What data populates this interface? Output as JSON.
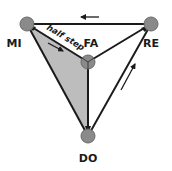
{
  "diagram": {
    "type": "tetrahedron",
    "nodes": [
      {
        "id": "mi",
        "label": "MI",
        "x": 27,
        "y": 24
      },
      {
        "id": "re",
        "label": "RE",
        "x": 151,
        "y": 24
      },
      {
        "id": "fa",
        "label": "FA",
        "x": 88,
        "y": 62
      },
      {
        "id": "do",
        "label": "DO",
        "x": 88,
        "y": 136
      }
    ],
    "edges": [
      {
        "from": "re",
        "to": "mi"
      },
      {
        "from": "mi",
        "to": "fa"
      },
      {
        "from": "fa",
        "to": "re"
      },
      {
        "from": "fa",
        "to": "do"
      },
      {
        "from": "do",
        "to": "re"
      },
      {
        "from": "mi",
        "to": "do"
      }
    ],
    "shaded_face": [
      "mi",
      "fa",
      "do"
    ],
    "annotation": "half step",
    "colors": {
      "node_fill": "#8a8a8a",
      "face_fill": "#bdbdbd",
      "stroke": "#1a1a1a"
    }
  }
}
